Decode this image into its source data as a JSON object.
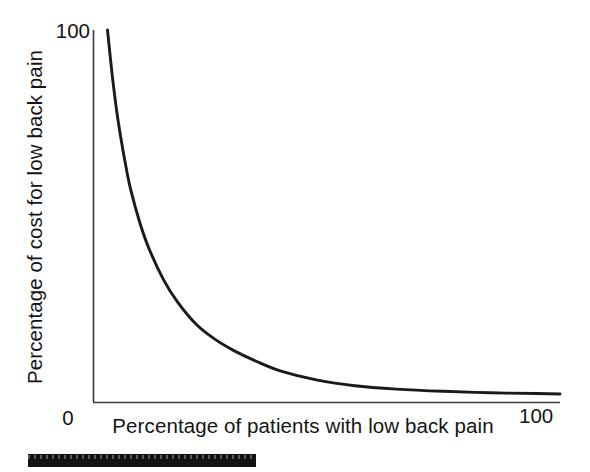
{
  "chart_data": {
    "type": "line",
    "title": "",
    "xlabel": "Percentage of patients with low back pain",
    "ylabel": "Percentage of cost for low back pain",
    "xlim": [
      0,
      100
    ],
    "ylim": [
      0,
      100
    ],
    "xticks": [
      "0",
      "100"
    ],
    "yticks": [
      "100"
    ],
    "grid": false,
    "legend": null,
    "annotations": [],
    "series": [
      {
        "name": "Cost concentration curve",
        "x": [
          3,
          4,
          5,
          6,
          7,
          8,
          10,
          12,
          15,
          18,
          22,
          26,
          30,
          35,
          40,
          48,
          56,
          65,
          75,
          85,
          95,
          100
        ],
        "y": [
          100,
          88,
          78,
          70,
          63,
          57,
          48,
          41,
          33,
          27,
          21,
          17,
          14,
          11,
          8.5,
          6,
          4.5,
          3.6,
          3.0,
          2.6,
          2.4,
          2.3
        ]
      }
    ]
  },
  "axes": {
    "y_tick_top_label": "100",
    "x_tick_min_label": "0",
    "x_tick_max_label": "100",
    "y_axis_title": "Percentage of cost for low back pain",
    "x_axis_title": "Percentage of patients with low back pain"
  },
  "artifacts": {
    "scan_bar_name": "scan-artifact-bar"
  },
  "colors": {
    "curve": "#1a1a1a",
    "axis": "#3a3a3a",
    "text": "#141414",
    "background": "#ffffff"
  }
}
